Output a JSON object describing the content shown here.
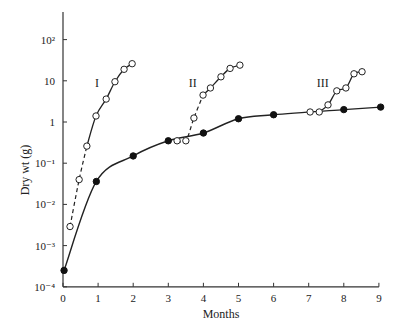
{
  "chart_data": {
    "type": "line",
    "title": "",
    "xlabel": "Months",
    "ylabel": "Dry wt (g)",
    "xlim": [
      0,
      9
    ],
    "ylim": [
      0.0001,
      1000
    ],
    "yscale": "log",
    "grid": false,
    "x_ticks": [
      "0",
      "1",
      "2",
      "3",
      "4",
      "5",
      "6",
      "7",
      "8",
      "9"
    ],
    "y_ticks": [
      {
        "value": 0.0001,
        "label": "10⁻⁴"
      },
      {
        "value": 0.001,
        "label": "10⁻³"
      },
      {
        "value": 0.01,
        "label": "10⁻²"
      },
      {
        "value": 0.1,
        "label": "10⁻¹"
      },
      {
        "value": 1,
        "label": "1"
      },
      {
        "value": 10,
        "label": "10"
      },
      {
        "value": 100,
        "label": "10²"
      }
    ],
    "series": [
      {
        "name": "Main (filled)",
        "marker": "filled-circle",
        "style": "solid",
        "points": [
          [
            0.03,
            0.00025
          ],
          [
            0.95,
            0.036
          ],
          [
            2.0,
            0.15
          ],
          [
            3.0,
            0.35
          ],
          [
            4.0,
            0.54
          ],
          [
            5.0,
            1.2
          ],
          [
            6.0,
            1.5
          ],
          [
            8.0,
            2.0
          ],
          [
            9.05,
            2.3
          ]
        ]
      },
      {
        "name": "I",
        "marker": "open-circle",
        "style": "solid",
        "dashed_segment_to_index": 2,
        "points": [
          [
            0.2,
            0.0029
          ],
          [
            0.46,
            0.04
          ],
          [
            0.68,
            0.26
          ],
          [
            0.94,
            1.4
          ],
          [
            1.23,
            3.6
          ],
          [
            1.48,
            9.5
          ],
          [
            1.74,
            19
          ],
          [
            1.97,
            26
          ]
        ]
      },
      {
        "name": "II",
        "marker": "open-circle",
        "style": "solid",
        "dashed_segment_to_index": 3,
        "points": [
          [
            3.25,
            0.35
          ],
          [
            3.5,
            0.35
          ],
          [
            3.73,
            1.25
          ],
          [
            3.99,
            4.5
          ],
          [
            4.2,
            6.7
          ],
          [
            4.5,
            12.5
          ],
          [
            4.76,
            20
          ],
          [
            5.04,
            24
          ]
        ]
      },
      {
        "name": "III",
        "marker": "open-circle",
        "style": "solid",
        "points": [
          [
            7.04,
            1.75
          ],
          [
            7.3,
            1.75
          ],
          [
            7.55,
            2.6
          ],
          [
            7.8,
            5.7
          ],
          [
            8.06,
            6.7
          ],
          [
            8.29,
            14.8
          ],
          [
            8.52,
            16.6
          ]
        ]
      }
    ],
    "annotations": [
      {
        "text": "I",
        "x": 0.97,
        "y": 9
      },
      {
        "text": "II",
        "x": 3.7,
        "y": 9
      },
      {
        "text": "III",
        "x": 7.4,
        "y": 9
      }
    ]
  },
  "labels": {
    "xlabel": "Months",
    "ylabel": "Dry wt (g)",
    "curve_I": "I",
    "curve_II": "II",
    "curve_III": "III"
  }
}
